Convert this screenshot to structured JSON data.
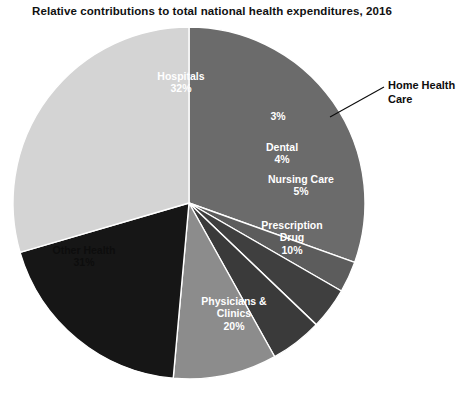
{
  "chart_data": {
    "type": "pie",
    "title": "Relative contributions to total national health expenditures, 2016",
    "xlabel": "",
    "ylabel": "",
    "legend": "none",
    "grid": false,
    "start_angle_deg": 0,
    "direction": "clockwise",
    "categories": [
      "Hospitals",
      "Home Health Care",
      "Dental",
      "Nursing Care",
      "Prescription Drug",
      "Physicians & Clinics",
      "Other Health"
    ],
    "values": [
      32,
      3,
      4,
      5,
      10,
      20,
      31
    ],
    "value_labels": [
      "32%",
      "3%",
      "4%",
      "5%",
      "10%",
      "20%",
      "31%"
    ],
    "colors": [
      "#6b6b6b",
      "#5c5c5c",
      "#3f3f3f",
      "#3a3a3a",
      "#8c8c8c",
      "#161616",
      "#d4d4d4"
    ],
    "slice_separator_color": "#ffffff"
  },
  "slices": [
    {
      "name": "Hospitals",
      "label_line1": "Hospitals",
      "label_line2": "32%",
      "value": 32,
      "color": "#6b6b6b",
      "label_style": "light",
      "label_left": 133,
      "label_top": 70,
      "label_width": 96
    },
    {
      "name": "Home Health Care",
      "label_line1": "",
      "label_line2": "3%",
      "value": 3,
      "color": "#5c5c5c",
      "label_style": "light",
      "label_left": 256,
      "label_top": 110,
      "label_width": 44
    },
    {
      "name": "Dental",
      "label_line1": "Dental",
      "label_line2": "4%",
      "value": 4,
      "color": "#3f3f3f",
      "label_style": "light",
      "label_left": 250,
      "label_top": 141,
      "label_width": 64
    },
    {
      "name": "Nursing Care",
      "label_line1": "Nursing Care",
      "label_line2": "5%",
      "value": 5,
      "color": "#3a3a3a",
      "label_style": "light",
      "label_left": 251,
      "label_top": 173,
      "label_width": 100
    },
    {
      "name": "Prescription Drug",
      "label_line1": "Prescription",
      "label_line2": "Drug",
      "label_line3": "10%",
      "value": 10,
      "color": "#8c8c8c",
      "label_style": "light",
      "label_left": 248,
      "label_top": 219,
      "label_width": 88
    },
    {
      "name": "Physicians & Clinics",
      "label_line1": "Physicians &",
      "label_line2": "Clinics",
      "label_line3": "20%",
      "value": 20,
      "color": "#161616",
      "label_style": "light",
      "label_left": 186,
      "label_top": 295,
      "label_width": 96
    },
    {
      "name": "Other Health",
      "label_line1": "Other Health",
      "label_line2": "31%",
      "value": 31,
      "color": "#d4d4d4",
      "label_style": "dark",
      "label_left": 36,
      "label_top": 244,
      "label_width": 96
    }
  ],
  "callout": {
    "name": "home-health-care",
    "line1": "Home Health",
    "line2": "Care",
    "text_left": 388,
    "text_top": 79,
    "leader_x1": 330,
    "leader_y1": 117,
    "leader_x2": 384,
    "leader_y2": 87,
    "color": "#0d0d0d"
  },
  "geometry": {
    "center_x": 189,
    "center_y": 203,
    "radius": 176
  }
}
